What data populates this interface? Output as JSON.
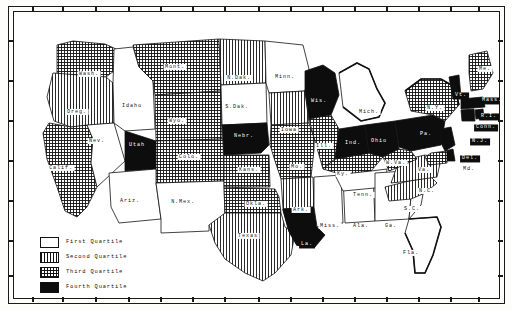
{
  "figure": {
    "kind": "choropleth-map",
    "region": "United States",
    "border_style": "double-rule plate frame with edge tick marks"
  },
  "legend": {
    "name": "quartile-legend",
    "entries": [
      {
        "label": "First Quartile",
        "pattern": "white",
        "swatch_class": "sw-q1"
      },
      {
        "label": "Second Quartile",
        "pattern": "vertical",
        "swatch_class": "sw-q2"
      },
      {
        "label": "Third Quartile",
        "pattern": "crosshatch",
        "swatch_class": "sw-q3"
      },
      {
        "label": "Fourth Quartile",
        "pattern": "solid-black",
        "swatch_class": "sw-q4"
      }
    ]
  },
  "colors": {
    "ink": "#111111",
    "paper": "#ffffff",
    "fourth_quartile": "#0d0d0d"
  },
  "chart_data": {
    "type": "map",
    "title": "",
    "legend_position": "bottom-left",
    "classes": [
      "First Quartile",
      "Second Quartile",
      "Third Quartile",
      "Fourth Quartile"
    ],
    "states": [
      {
        "label": "Wash.",
        "quartile": 3,
        "x": 76,
        "y": 63
      },
      {
        "label": "Oreg.",
        "quartile": 2,
        "x": 64,
        "y": 101
      },
      {
        "label": "Calif.",
        "quartile": 3,
        "x": 48,
        "y": 157
      },
      {
        "label": "Nev.",
        "quartile": 1,
        "x": 84,
        "y": 130
      },
      {
        "label": "Idaho",
        "quartile": 1,
        "x": 119,
        "y": 95
      },
      {
        "label": "Mont.",
        "quartile": 3,
        "x": 162,
        "y": 56
      },
      {
        "label": "Wyo.",
        "quartile": 3,
        "x": 164,
        "y": 110
      },
      {
        "label": "Utah",
        "quartile": 4,
        "x": 124,
        "y": 135
      },
      {
        "label": "Colo.",
        "quartile": 3,
        "x": 176,
        "y": 146
      },
      {
        "label": "Ariz.",
        "quartile": 1,
        "x": 117,
        "y": 190
      },
      {
        "label": "N.Mex.",
        "quartile": 1,
        "x": 170,
        "y": 191
      },
      {
        "label": "N.Dak.",
        "quartile": 2,
        "x": 226,
        "y": 67
      },
      {
        "label": "S.Dak.",
        "quartile": 1,
        "x": 224,
        "y": 96
      },
      {
        "label": "Nebr.",
        "quartile": 4,
        "x": 231,
        "y": 126
      },
      {
        "label": "Kans.",
        "quartile": 3,
        "x": 236,
        "y": 159
      },
      {
        "label": "Okla.",
        "quartile": 3,
        "x": 243,
        "y": 193
      },
      {
        "label": "Texas",
        "quartile": 2,
        "x": 235,
        "y": 225
      },
      {
        "label": "Minn.",
        "quartile": 1,
        "x": 272,
        "y": 66
      },
      {
        "label": "Iowa",
        "quartile": 2,
        "x": 276,
        "y": 119
      },
      {
        "label": "Mo.",
        "quartile": 3,
        "x": 284,
        "y": 156
      },
      {
        "label": "Ark.",
        "quartile": 2,
        "x": 288,
        "y": 199
      },
      {
        "label": "La.",
        "quartile": 4,
        "x": 294,
        "y": 234
      },
      {
        "label": "Wis.",
        "quartile": 4,
        "x": 306,
        "y": 91
      },
      {
        "label": "Ill.",
        "quartile": 3,
        "x": 311,
        "y": 135
      },
      {
        "label": "Miss.",
        "quartile": 1,
        "x": 317,
        "y": 215
      },
      {
        "label": "Ala.",
        "quartile": 1,
        "x": 348,
        "y": 215
      },
      {
        "label": "Ky.",
        "quartile": 3,
        "x": 330,
        "y": 163
      },
      {
        "label": "Tenn.",
        "quartile": 1,
        "x": 350,
        "y": 184
      },
      {
        "label": "Ind.",
        "quartile": 4,
        "x": 340,
        "y": 133
      },
      {
        "label": "Ohio",
        "quartile": 4,
        "x": 366,
        "y": 131
      },
      {
        "label": "Mich.",
        "quartile": 1,
        "x": 356,
        "y": 101
      },
      {
        "label": "Ga.",
        "quartile": 1,
        "x": 378,
        "y": 215
      },
      {
        "label": "Fla.",
        "quartile": 1,
        "x": 398,
        "y": 242
      },
      {
        "label": "S.C.",
        "quartile": 1,
        "x": 399,
        "y": 198
      },
      {
        "label": "N.C.",
        "quartile": 2,
        "x": 414,
        "y": 180
      },
      {
        "label": "Va.",
        "quartile": 2,
        "x": 411,
        "y": 159
      },
      {
        "label": "W.Va.",
        "quartile": 3,
        "x": 383,
        "y": 152
      },
      {
        "label": "Pa.",
        "quartile": 4,
        "x": 413,
        "y": 124
      },
      {
        "label": "N.Y.",
        "quartile": 3,
        "x": 422,
        "y": 97
      },
      {
        "label": "Vt.",
        "quartile": 4,
        "x": 448,
        "y": 85
      },
      {
        "label": "Me.",
        "quartile": 3,
        "x": 472,
        "y": 58
      },
      {
        "label": "Mass.",
        "quartile": 4,
        "x": 479,
        "y": 90
      },
      {
        "label": "R.I.",
        "quartile": 4,
        "x": 476,
        "y": 106
      },
      {
        "label": "Conn.",
        "quartile": 4,
        "x": 473,
        "y": 117
      },
      {
        "label": "N.J.",
        "quartile": 4,
        "x": 467,
        "y": 131
      },
      {
        "label": "Del.",
        "quartile": 4,
        "x": 457,
        "y": 148
      },
      {
        "label": "Md.",
        "quartile": 3,
        "x": 456,
        "y": 158
      }
    ]
  }
}
